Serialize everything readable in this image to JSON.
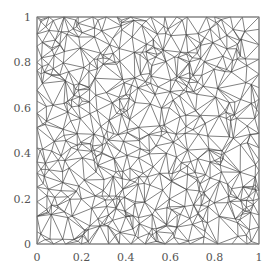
{
  "chart_data": {
    "type": "scatter",
    "subtype": "triangulation-mesh",
    "title": "",
    "xlabel": "",
    "ylabel": "",
    "xlim": [
      0,
      1
    ],
    "ylim": [
      0,
      1
    ],
    "grid": false,
    "legend": null,
    "x_ticks": [
      {
        "value": 0,
        "label": "0"
      },
      {
        "value": 0.2,
        "label": "0.2"
      },
      {
        "value": 0.4,
        "label": "0.4"
      },
      {
        "value": 0.6,
        "label": "0.6"
      },
      {
        "value": 0.8,
        "label": "0.8"
      },
      {
        "value": 1,
        "label": "1"
      }
    ],
    "y_ticks": [
      {
        "value": 0,
        "label": "0"
      },
      {
        "value": 0.2,
        "label": "0.2"
      },
      {
        "value": 0.4,
        "label": "0.4"
      },
      {
        "value": 0.6,
        "label": "0.6"
      },
      {
        "value": 0.8,
        "label": "0.8"
      },
      {
        "value": 1,
        "label": "1"
      }
    ],
    "mesh": {
      "description": "Unstructured Delaunay triangulation of random points in the unit square",
      "approx_interior_points": 520,
      "approx_boundary_points_per_side": 16,
      "seed": 7,
      "edge_color": "#444444"
    }
  },
  "layout": {
    "plot_left": 37,
    "plot_top": 17,
    "plot_width": 222,
    "plot_height": 227,
    "axis_color": "#888888",
    "label_color": "#555555"
  }
}
